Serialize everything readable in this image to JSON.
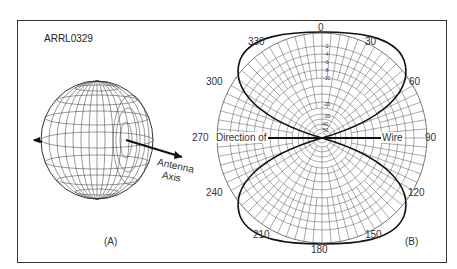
{
  "figure": {
    "code": "ARRL0329",
    "panel_a": {
      "label": "(A)",
      "axis_label_line1": "Antenna",
      "axis_label_line2": "Axis"
    },
    "panel_b": {
      "label": "(B)",
      "direction_left": "Direction of",
      "direction_right": "Wire",
      "angle_labels": {
        "a0": "0",
        "a30": "30",
        "a60": "60",
        "a90": "90",
        "a120": "120",
        "a150": "150",
        "a180": "180",
        "a210": "210",
        "a240": "240",
        "a270": "270",
        "a300": "300",
        "a330": "330"
      },
      "db_scale": [
        "-2",
        "-4",
        "-6",
        "-8",
        "-10",
        "-20",
        "-30",
        "-40",
        "-50"
      ]
    }
  },
  "colors": {
    "line": "#1a1a1a",
    "grid": "#555555",
    "frame": "#333333"
  }
}
